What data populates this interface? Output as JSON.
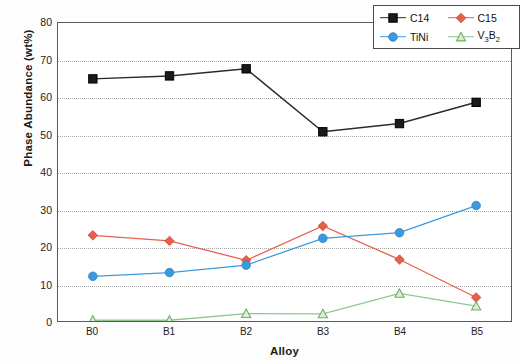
{
  "chart_data": {
    "type": "line",
    "title": "",
    "xlabel": "Alloy",
    "ylabel": "Phase Abundance (wt%)",
    "categories": [
      "B0",
      "B1",
      "B2",
      "B3",
      "B4",
      "B5"
    ],
    "ylim": [
      0,
      80
    ],
    "yticks": [
      0,
      10,
      20,
      30,
      40,
      50,
      60,
      70,
      80
    ],
    "grid": true,
    "legend_position": "top-right",
    "series": [
      {
        "name": "C14",
        "color": "#1a1a1a",
        "marker": "square",
        "values": [
          65.0,
          65.8,
          67.7,
          50.8,
          53.0,
          58.7
        ]
      },
      {
        "name": "C15",
        "color": "#e8604c",
        "marker": "diamond",
        "values": [
          23.0,
          21.5,
          16.3,
          25.5,
          16.5,
          6.3
        ]
      },
      {
        "name": "TiNi",
        "color": "#3a9ae0",
        "marker": "circle",
        "values": [
          12.0,
          13.0,
          15.0,
          22.2,
          23.7,
          31.0
        ]
      },
      {
        "name": "V3B2",
        "label_html": "V<sub>3</sub>B<sub>2</sub>",
        "color": "#8dc98d",
        "marker": "triangle",
        "values": [
          0.2,
          0.2,
          2.0,
          1.9,
          7.4,
          4.0
        ]
      }
    ]
  },
  "axis": {
    "y_label": "Phase Abundance (wt%)",
    "x_label": "Alloy",
    "y_tick_labels": [
      "80",
      "70",
      "60",
      "50",
      "40",
      "30",
      "20",
      "10",
      "0"
    ],
    "x_tick_labels": [
      "B0",
      "B1",
      "B2",
      "B3",
      "B4",
      "B5"
    ]
  },
  "legend": {
    "entries": [
      {
        "label": "C14"
      },
      {
        "label": "C15"
      },
      {
        "label": "TiNi"
      },
      {
        "label": "V3B2"
      }
    ]
  }
}
